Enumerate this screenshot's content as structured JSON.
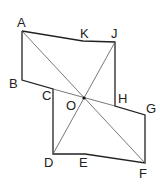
{
  "diagram": {
    "type": "geometry-figure",
    "points": {
      "A": {
        "label": "A",
        "x": 22,
        "y": 31
      },
      "K": {
        "label": "K",
        "x": 83,
        "y": 41
      },
      "J": {
        "label": "J",
        "x": 115,
        "y": 42
      },
      "B": {
        "label": "B",
        "x": 22,
        "y": 80
      },
      "C": {
        "label": "C",
        "x": 53,
        "y": 89
      },
      "O": {
        "label": "O",
        "x": 84,
        "y": 98
      },
      "H": {
        "label": "H",
        "x": 115,
        "y": 106
      },
      "G": {
        "label": "G",
        "x": 145,
        "y": 115
      },
      "D": {
        "label": "D",
        "x": 53,
        "y": 154
      },
      "E": {
        "label": "E",
        "x": 85,
        "y": 154
      },
      "F": {
        "label": "F",
        "x": 145,
        "y": 163
      }
    },
    "outline": [
      "A",
      "K",
      "J",
      "H",
      "G",
      "F",
      "E",
      "D",
      "C",
      "B",
      "A"
    ],
    "thin_lines": [
      [
        "A",
        "F"
      ],
      [
        "J",
        "D"
      ],
      [
        "B",
        "G"
      ]
    ],
    "colors": {
      "stroke": "#222222",
      "thin": "#555555",
      "background": "#ffffff"
    }
  }
}
